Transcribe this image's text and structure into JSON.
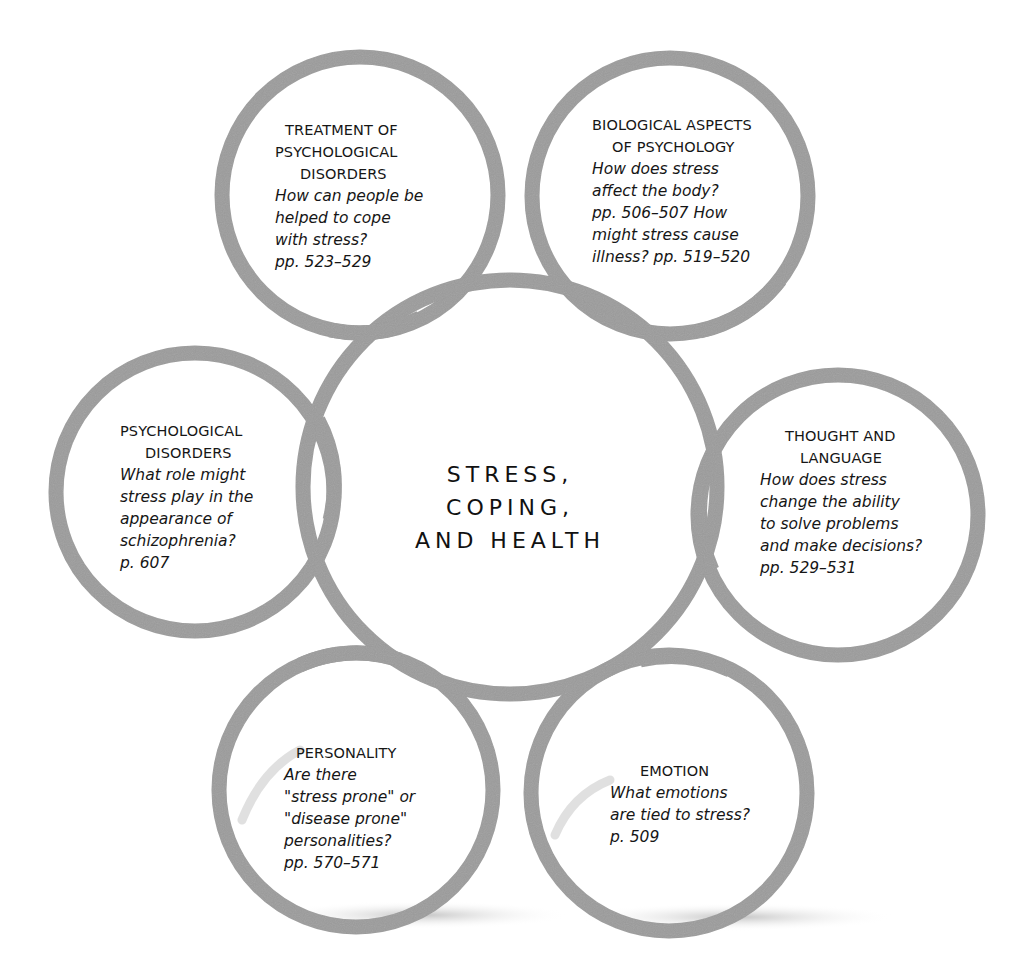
{
  "diagram": {
    "type": "concept-ring-diagram",
    "ring_color": "#9a9a9a",
    "shadow_color": "#d0d0d0",
    "center": {
      "lines": [
        "STRESS,",
        "COPING,",
        "AND HEALTH"
      ]
    },
    "nodes": [
      {
        "id": "treatment",
        "title_lines": [
          "TREATMENT OF",
          "PSYCHOLOGICAL",
          "DISORDERS"
        ],
        "body_lines": [
          "How can people be",
          "helped to cope",
          "with stress?",
          "pp. 523–529"
        ]
      },
      {
        "id": "biological",
        "title_lines": [
          "BIOLOGICAL ASPECTS",
          "OF PSYCHOLOGY"
        ],
        "body_lines": [
          "How does stress",
          "affect the body?",
          "pp. 506–507 How",
          "might stress cause",
          "illness? pp. 519–520"
        ]
      },
      {
        "id": "psychological-disorders",
        "title_lines": [
          "PSYCHOLOGICAL",
          "DISORDERS"
        ],
        "body_lines": [
          "What role might",
          "stress play in the",
          "appearance of",
          "schizophrenia?",
          "p. 607"
        ]
      },
      {
        "id": "thought-language",
        "title_lines": [
          "THOUGHT AND",
          "LANGUAGE"
        ],
        "body_lines": [
          "How does stress",
          "change the ability",
          "to solve problems",
          "and make decisions?",
          "pp. 529–531"
        ]
      },
      {
        "id": "personality",
        "title_lines": [
          "PERSONALITY"
        ],
        "body_lines": [
          "Are there",
          "\"stress prone\" or",
          "\"disease prone\"",
          "personalities?",
          "pp. 570–571"
        ]
      },
      {
        "id": "emotion",
        "title_lines": [
          "EMOTION"
        ],
        "body_lines": [
          "What emotions",
          "are tied to stress?",
          "p. 509"
        ]
      }
    ]
  }
}
